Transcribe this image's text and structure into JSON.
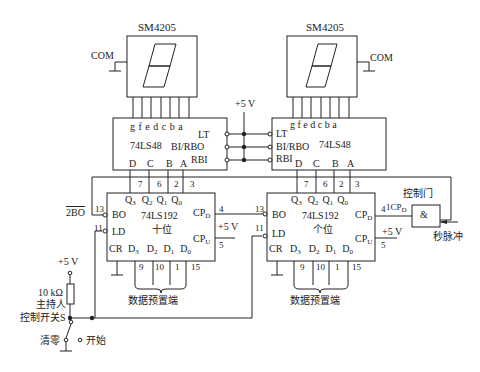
{
  "display_left": {
    "model": "SM4205",
    "com": "COM"
  },
  "display_right": {
    "model": "SM4205",
    "com": "COM"
  },
  "decoder_left": {
    "model": "74LS48",
    "seg_pins": "g f e d c b a",
    "lt": "LT",
    "bi": "BI/RBO",
    "rbi": "RBI",
    "d": "D",
    "c": "C",
    "b": "B",
    "a": "A"
  },
  "decoder_right": {
    "model": "74LS48",
    "seg_pins": "g f e d c b a",
    "lt": "LT",
    "bi": "BI/RBO",
    "rbi": "RBI",
    "d": "D",
    "c": "C",
    "b": "B",
    "a": "A"
  },
  "vcc_top": "+5 V",
  "counter_tens": {
    "model": "74LS192",
    "role": "十位",
    "q3": "Q3",
    "q2": "Q2",
    "q1": "Q1",
    "q0": "Q0",
    "pin7": "7",
    "pin6": "6",
    "pin2": "2",
    "pin3": "3",
    "bo": "BO",
    "bo_pin": "13",
    "bo_ext": "2BO",
    "ld": "LD",
    "ld_pin": "11",
    "cr": "CR",
    "d3": "D3",
    "d2": "D2",
    "d1": "D1",
    "d0": "D0",
    "pin9": "9",
    "pin10": "10",
    "pin1": "1",
    "pin15": "15",
    "cpd": "CPD",
    "cpd_pin": "4",
    "cpu": "CPU",
    "cpu_pin": "5",
    "preset_label": "数据预置端"
  },
  "counter_units": {
    "model": "74LS192",
    "role": "个位",
    "q3": "Q3",
    "q2": "Q2",
    "q1": "Q1",
    "q0": "Q0",
    "pin7": "7",
    "pin6": "6",
    "pin2": "2",
    "pin3": "3",
    "bo": "BO",
    "bo_pin": "13",
    "ld": "LD",
    "ld_pin": "11",
    "cr": "CR",
    "d3": "D3",
    "d2": "D2",
    "d1": "D1",
    "d0": "D0",
    "pin9": "9",
    "pin10": "10",
    "pin1": "1",
    "pin15": "15",
    "cpd": "CPD",
    "cpd_pin": "4",
    "cpu": "CPU",
    "cpu_pin": "5",
    "preset_label": "数据预置端"
  },
  "vcc_cpu_tens": "+5 V",
  "vcc_cpu_units": "+5 V",
  "control_gate": {
    "label": "控制门",
    "symbol": "&",
    "input_label": "1CPD",
    "pulse": "秒脉冲"
  },
  "switch_circuit": {
    "vcc": "+5 V",
    "resistor": "10 kΩ",
    "label_line1": "主持人",
    "label_line2": "控制开关S",
    "clear": "清零",
    "start": "开始"
  }
}
